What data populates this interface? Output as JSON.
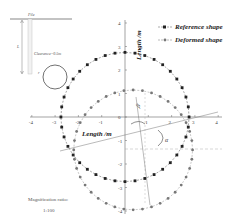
{
  "chart_data": {
    "type": "scatter",
    "title": "",
    "xlabel": "Length /m",
    "ylabel": "Length /m",
    "xlim": [
      -4,
      4
    ],
    "ylim": [
      -4,
      4
    ],
    "x_ticks": [
      "-4",
      "-3",
      "-2",
      "-1",
      "1",
      "2",
      "3",
      "4"
    ],
    "y_ticks": [
      "4",
      "3",
      "2",
      "1",
      "0",
      "-1",
      "-2",
      "-3",
      "-4"
    ],
    "grid": false,
    "legend_position": "upper right",
    "series": [
      {
        "name": "Reference shape",
        "marker": "square",
        "color": "#222222",
        "shape": "circle",
        "center": [
          0,
          0
        ],
        "radius": 2.75,
        "points": 40
      },
      {
        "name": "Deformed shape",
        "marker": "dot",
        "color": "#777777",
        "shape": "circle",
        "center": [
          0.35,
          -1.4
        ],
        "radius": 2.55,
        "points": 40
      }
    ],
    "annotations": [
      {
        "text": "β",
        "near": [
          0.6,
          0.4
        ]
      },
      {
        "text": "α",
        "near": [
          1.6,
          -1.0
        ]
      }
    ]
  },
  "legend": {
    "reference": "Reference shape",
    "deformed": "Deformed shape"
  },
  "inset": {
    "pile_label": "Pile",
    "depth_label": "L",
    "clearance_label": "Clearance=0.5m",
    "radius_label": "r"
  },
  "axes": {
    "xlabel": "Length /m",
    "ylabel": "Length /m"
  },
  "annotations": {
    "beta": "β",
    "alpha": "α"
  },
  "magnification": {
    "label": "Magnification ratio:",
    "value": "1:100"
  }
}
